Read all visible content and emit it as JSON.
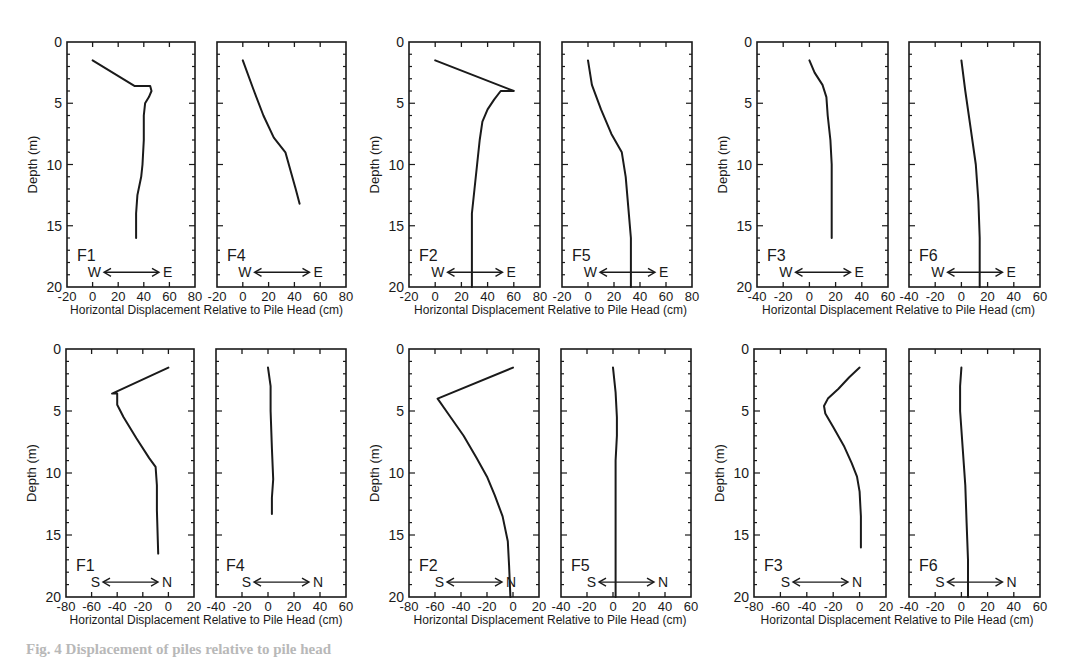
{
  "figure": {
    "caption": "Fig. 4 Displacement of piles relative to pile head",
    "xlabel": "Horizontal Displacement Relative to Pile Head (cm)",
    "ylabel": "Depth (m)"
  },
  "chart_data": [
    {
      "type": "line",
      "panel": "top-left-a",
      "label": "F1",
      "direction": [
        "W",
        "E"
      ],
      "xlim": [
        -20,
        80
      ],
      "xticks": [
        -20,
        0,
        20,
        40,
        60,
        80
      ],
      "ylim": [
        20,
        0
      ],
      "yticks": [
        0,
        5,
        10,
        15,
        20
      ],
      "ylabel": "Depth (m)",
      "x": [
        0,
        33,
        45,
        46,
        44,
        41,
        40,
        40,
        39,
        38,
        35,
        34,
        34
      ],
      "y": [
        1.5,
        3.6,
        3.6,
        4.0,
        4.5,
        5.0,
        6.0,
        8.0,
        10.0,
        11.0,
        12.5,
        14.0,
        16.0
      ]
    },
    {
      "type": "line",
      "panel": "top-left-b",
      "label": "F4",
      "direction": [
        "W",
        "E"
      ],
      "xlim": [
        -20,
        80
      ],
      "xticks": [
        -20,
        0,
        20,
        40,
        60,
        80
      ],
      "ylim": [
        20,
        0
      ],
      "yticks": [
        0,
        5,
        10,
        15,
        20
      ],
      "x": [
        0,
        8,
        16,
        24,
        33,
        37,
        41,
        44
      ],
      "y": [
        1.5,
        3.8,
        6.0,
        7.8,
        9.0,
        10.5,
        12.0,
        13.2
      ]
    },
    {
      "type": "line",
      "panel": "top-middle-a",
      "label": "F2",
      "direction": [
        "W",
        "E"
      ],
      "xlim": [
        -20,
        80
      ],
      "xticks": [
        -20,
        0,
        20,
        40,
        60,
        80
      ],
      "ylim": [
        20,
        0
      ],
      "yticks": [
        0,
        5,
        10,
        15,
        20
      ],
      "ylabel": "Depth (m)",
      "x": [
        0,
        60,
        50,
        45,
        40,
        36,
        34,
        32,
        30,
        28,
        28,
        28
      ],
      "y": [
        1.5,
        4.0,
        4.0,
        4.7,
        5.5,
        6.5,
        8.0,
        10.0,
        12.0,
        14.0,
        17.0,
        20.0
      ]
    },
    {
      "type": "line",
      "panel": "top-middle-b",
      "label": "F5",
      "direction": [
        "W",
        "E"
      ],
      "xlim": [
        -20,
        80
      ],
      "xticks": [
        -20,
        0,
        20,
        40,
        60,
        80
      ],
      "ylim": [
        20,
        0
      ],
      "yticks": [
        0,
        5,
        10,
        15,
        20
      ],
      "x": [
        0,
        3,
        10,
        18,
        26,
        29,
        31,
        33,
        33
      ],
      "y": [
        1.5,
        3.5,
        5.5,
        7.5,
        9.0,
        11.0,
        13.5,
        16.0,
        20.0
      ]
    },
    {
      "type": "line",
      "panel": "top-right-a",
      "label": "F3",
      "direction": [
        "W",
        "E"
      ],
      "xlim": [
        -40,
        60
      ],
      "xticks": [
        -40,
        -20,
        0,
        20,
        40,
        60
      ],
      "ylim": [
        20,
        0
      ],
      "yticks": [
        0,
        5,
        10,
        15,
        20
      ],
      "ylabel": "Depth (m)",
      "x": [
        0,
        4,
        10,
        13,
        14,
        16,
        17,
        17,
        17
      ],
      "y": [
        1.5,
        2.5,
        3.5,
        4.5,
        6.0,
        8.0,
        10.0,
        13.0,
        16.0
      ]
    },
    {
      "type": "line",
      "panel": "top-right-b",
      "label": "F6",
      "direction": [
        "W",
        "E"
      ],
      "xlim": [
        -40,
        60
      ],
      "xticks": [
        -40,
        -20,
        0,
        20,
        40,
        60
      ],
      "ylim": [
        20,
        0
      ],
      "yticks": [
        0,
        5,
        10,
        15,
        20
      ],
      "x": [
        0,
        3,
        7,
        11,
        13,
        14,
        14
      ],
      "y": [
        1.5,
        4.0,
        7.0,
        10.0,
        13.0,
        16.0,
        20.0
      ]
    },
    {
      "type": "line",
      "panel": "bottom-left-a",
      "label": "F1",
      "direction": [
        "S",
        "N"
      ],
      "xlim": [
        -80,
        20
      ],
      "xticks": [
        -80,
        -60,
        -40,
        -20,
        0,
        20
      ],
      "ylim": [
        20,
        0
      ],
      "yticks": [
        0,
        5,
        10,
        15,
        20
      ],
      "ylabel": "Depth (m)",
      "x": [
        0,
        -44,
        -40,
        -40,
        -35,
        -25,
        -15,
        -10,
        -9,
        -9,
        -8
      ],
      "y": [
        1.5,
        3.6,
        3.6,
        4.5,
        5.5,
        7.2,
        8.8,
        9.5,
        11.0,
        13.0,
        16.5
      ]
    },
    {
      "type": "line",
      "panel": "bottom-left-b",
      "label": "F4",
      "direction": [
        "S",
        "N"
      ],
      "xlim": [
        -40,
        60
      ],
      "xticks": [
        -40,
        -20,
        0,
        20,
        40,
        60
      ],
      "ylim": [
        20,
        0
      ],
      "yticks": [
        0,
        5,
        10,
        15,
        20
      ],
      "x": [
        0,
        2,
        2,
        3,
        4,
        3,
        3
      ],
      "y": [
        1.5,
        3.0,
        5.0,
        8.0,
        10.5,
        12.0,
        13.3
      ]
    },
    {
      "type": "line",
      "panel": "bottom-middle-a",
      "label": "F2",
      "direction": [
        "S",
        "N"
      ],
      "xlim": [
        -80,
        20
      ],
      "xticks": [
        -80,
        -60,
        -40,
        -20,
        0,
        20
      ],
      "ylim": [
        20,
        0
      ],
      "yticks": [
        0,
        5,
        10,
        15,
        20
      ],
      "ylabel": "Depth (m)",
      "x": [
        0,
        -58,
        -50,
        -38,
        -28,
        -20,
        -14,
        -8,
        -4,
        -3,
        -2
      ],
      "y": [
        1.5,
        4.0,
        5.2,
        7.0,
        8.8,
        10.3,
        11.8,
        13.5,
        15.5,
        17.5,
        20.0
      ]
    },
    {
      "type": "line",
      "panel": "bottom-middle-b",
      "label": "F5",
      "direction": [
        "S",
        "N"
      ],
      "xlim": [
        -40,
        60
      ],
      "xticks": [
        -40,
        -20,
        0,
        20,
        40,
        60
      ],
      "ylim": [
        20,
        0
      ],
      "yticks": [
        0,
        5,
        10,
        15,
        20
      ],
      "x": [
        0,
        2,
        3,
        3,
        2,
        2,
        2
      ],
      "y": [
        1.5,
        3.5,
        5.5,
        7.0,
        9.0,
        14.0,
        20.0
      ]
    },
    {
      "type": "line",
      "panel": "bottom-right-a",
      "label": "F3",
      "direction": [
        "S",
        "N"
      ],
      "xlim": [
        -80,
        20
      ],
      "xticks": [
        -80,
        -60,
        -40,
        -20,
        0,
        20
      ],
      "ylim": [
        20,
        0
      ],
      "yticks": [
        0,
        5,
        10,
        15,
        20
      ],
      "ylabel": "Depth (m)",
      "x": [
        0,
        -8,
        -16,
        -24,
        -27,
        -26,
        -20,
        -12,
        -6,
        -2,
        0,
        1,
        1
      ],
      "y": [
        1.5,
        2.3,
        3.2,
        4.0,
        4.6,
        5.2,
        6.3,
        7.8,
        9.2,
        10.3,
        11.5,
        13.5,
        16.0
      ]
    },
    {
      "type": "line",
      "panel": "bottom-right-b",
      "label": "F6",
      "direction": [
        "S",
        "N"
      ],
      "xlim": [
        -40,
        60
      ],
      "xticks": [
        -40,
        -20,
        0,
        20,
        40,
        60
      ],
      "ylim": [
        20,
        0
      ],
      "yticks": [
        0,
        5,
        10,
        15,
        20
      ],
      "x": [
        0,
        -1,
        -1,
        1,
        3,
        4,
        5,
        5
      ],
      "y": [
        1.5,
        3.0,
        5.0,
        8.0,
        11.0,
        14.0,
        17.0,
        20.0
      ]
    }
  ]
}
